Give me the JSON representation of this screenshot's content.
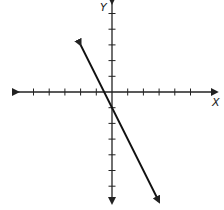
{
  "chart_data": {
    "type": "line",
    "title": "",
    "xlabel": "X",
    "ylabel": "Y",
    "xlim": [
      -6.5,
      6.8
    ],
    "ylim": [
      -7.2,
      5.8
    ],
    "grid": false,
    "x_ticks": [
      -5,
      -4,
      -3,
      -2,
      -1,
      1,
      2,
      3,
      4,
      5
    ],
    "y_ticks": [
      -6,
      -5,
      -4,
      -3,
      -2,
      -1,
      1,
      2,
      3,
      4,
      5
    ],
    "series": [
      {
        "name": "line",
        "equation": "y = -2x - 1",
        "slope": -2,
        "intercept": -1,
        "x": [
          -2,
          3
        ],
        "y": [
          3,
          -7
        ],
        "arrows": "both"
      }
    ],
    "colors": {
      "axis": "#222222",
      "line": "#111111"
    }
  }
}
